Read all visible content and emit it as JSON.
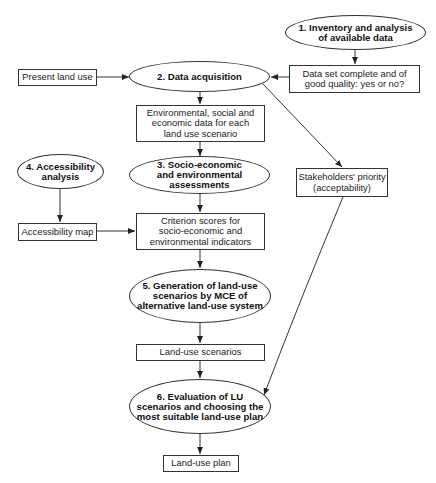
{
  "diagram": {
    "type": "flowchart",
    "nodes": {
      "n1": {
        "label": "1. Inventory and analysis\nof available data",
        "shape": "ellipse"
      },
      "data_check": {
        "label": "Data set complete and of\ngood quality: yes or no?",
        "shape": "rect"
      },
      "present_land_use": {
        "label": "Present land use",
        "shape": "rect"
      },
      "n2": {
        "label": "2. Data acquisition",
        "shape": "ellipse"
      },
      "env_data": {
        "label": "Environmental, social and\neconomic data for each\nland use scenario",
        "shape": "rect"
      },
      "n4": {
        "label": "4. Accessibility\nanalysis",
        "shape": "ellipse"
      },
      "n3": {
        "label": "3. Socio-economic\nand environmental\nassessments",
        "shape": "ellipse"
      },
      "stakeholders": {
        "label": "Stakeholders' priority\n(acceptability)",
        "shape": "rect"
      },
      "access_map": {
        "label": "Accessibility map",
        "shape": "rect"
      },
      "criterion": {
        "label": "Criterion scores for\nsocio-economic and\nenvironmental indicators",
        "shape": "rect"
      },
      "n5": {
        "label": "5. Generation of land-use\nscenarios by MCE of\nalternative land-use system",
        "shape": "ellipse"
      },
      "lu_scenarios": {
        "label": "Land-use scenarios",
        "shape": "rect"
      },
      "n6": {
        "label": "6. Evaluation of LU\nscenarios and choosing the\nmost suitable land-use plan",
        "shape": "ellipse"
      },
      "lu_plan": {
        "label": "Land-use plan",
        "shape": "rect"
      }
    },
    "edges": [
      {
        "from": "n1",
        "to": "data_check"
      },
      {
        "from": "data_check",
        "to": "n2"
      },
      {
        "from": "present_land_use",
        "to": "n2"
      },
      {
        "from": "n2",
        "to": "env_data"
      },
      {
        "from": "n2",
        "to": "stakeholders"
      },
      {
        "from": "env_data",
        "to": "n3"
      },
      {
        "from": "n4",
        "to": "access_map"
      },
      {
        "from": "n3",
        "to": "criterion"
      },
      {
        "from": "access_map",
        "to": "criterion"
      },
      {
        "from": "criterion",
        "to": "n5"
      },
      {
        "from": "n5",
        "to": "lu_scenarios"
      },
      {
        "from": "lu_scenarios",
        "to": "n6"
      },
      {
        "from": "stakeholders",
        "to": "n6"
      },
      {
        "from": "n6",
        "to": "lu_plan"
      }
    ],
    "colors": {
      "stroke": "#333333",
      "fill": "#ffffff",
      "text": "#111111"
    }
  }
}
